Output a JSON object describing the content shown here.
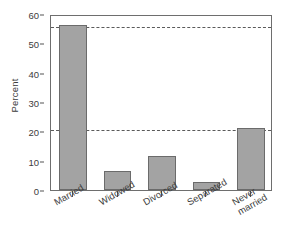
{
  "chart_data": {
    "type": "bar",
    "title": "",
    "xlabel": "",
    "ylabel": "Percent",
    "categories": [
      "Married",
      "Widowed",
      "Divorced",
      "Separated",
      "Never\nmarried"
    ],
    "values": [
      56.4,
      6.6,
      11.5,
      2.8,
      21.2
    ],
    "ylim": [
      0,
      60
    ],
    "yticks": [
      0,
      10,
      20,
      30,
      40,
      50,
      60
    ],
    "ytick_labels": [
      "0",
      "10",
      "20",
      "30",
      "40",
      "50",
      "60"
    ],
    "grid": false,
    "legend": null,
    "reference_lines": [
      {
        "value": 56.4,
        "style": "dashed"
      },
      {
        "value": 21.2,
        "style": "dashed"
      }
    ],
    "colors": {
      "bar_fill": "#a3a3a3",
      "bar_edge": "#6b6b6b",
      "axis": "#6e6e6e",
      "text": "#3c3c3c",
      "reference_line": "#5a5a5a",
      "background": "#ffffff"
    }
  }
}
